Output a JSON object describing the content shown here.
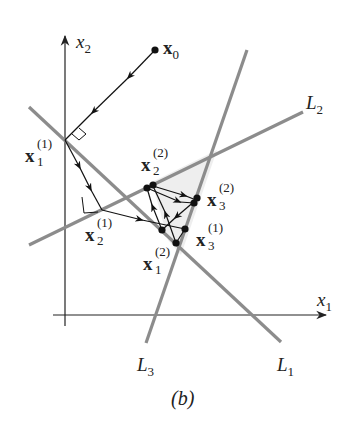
{
  "caption": "(b)",
  "labels": {
    "x1_axis": {
      "base": "x",
      "sub": "1"
    },
    "x2_axis": {
      "base": "x",
      "sub": "2"
    },
    "L1": {
      "base": "L",
      "sub": "1"
    },
    "L2": {
      "base": "L",
      "sub": "2"
    },
    "L3": {
      "base": "L",
      "sub": "3"
    },
    "x0": {
      "base": "x",
      "sub": "0"
    },
    "x1_1": {
      "base": "x",
      "sub": "1",
      "sup": "(1)"
    },
    "x2_1": {
      "base": "x",
      "sub": "2",
      "sup": "(1)"
    },
    "x3_1": {
      "base": "x",
      "sub": "3",
      "sup": "(1)"
    },
    "x1_2": {
      "base": "x",
      "sub": "1",
      "sup": "(2)"
    },
    "x2_2": {
      "base": "x",
      "sub": "2",
      "sup": "(2)"
    },
    "x3_2": {
      "base": "x",
      "sub": "3",
      "sup": "(2)"
    }
  },
  "colors": {
    "constraint_line": "#8c8c8c",
    "path": "#111111",
    "axis": "#222222",
    "feasible_region": "#eeeeee"
  },
  "geometry": {
    "origin": [
      65,
      315
    ],
    "lines": {
      "L1": [
        [
          29,
          107
        ],
        [
          281,
          342
        ]
      ],
      "L2": [
        [
          29,
          245
        ],
        [
          303,
          112
        ]
      ],
      "L3": [
        [
          146,
          343
        ],
        [
          247,
          50
        ]
      ]
    },
    "points": {
      "x0": [
        155,
        50
      ],
      "x1_1": [
        65,
        140
      ],
      "x2_1": [
        102,
        210
      ],
      "x3_1": [
        185,
        229
      ],
      "x1_2": [
        176,
        243
      ],
      "x2_2": [
        149,
        187
      ],
      "x3_2": [
        196,
        200
      ]
    }
  }
}
